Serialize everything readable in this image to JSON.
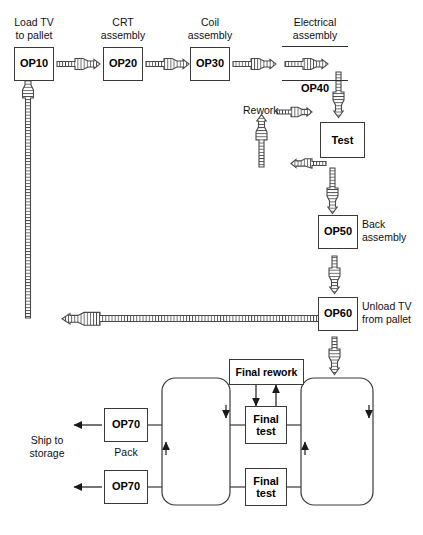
{
  "diagram": {
    "line_color": "#3a3a3a",
    "fill_color": "#ffffff",
    "text_color": "#000000"
  },
  "stations": {
    "op10": {
      "code": "OP10",
      "caption": "Load TV\nto pallet"
    },
    "op20": {
      "code": "OP20",
      "caption": "CRT\nassembly"
    },
    "op30": {
      "code": "OP30",
      "caption": "Coil\nassembly"
    },
    "op40": {
      "code": "OP40",
      "caption": "Electrical\nassembly"
    },
    "op50": {
      "code": "OP50",
      "caption": "Back\nassembly"
    },
    "op60": {
      "code": "OP60",
      "caption": "Unload TV\nfrom pallet"
    },
    "op70_upper": {
      "code": "OP70",
      "caption": "Pack"
    },
    "op70_lower": {
      "code": "OP70",
      "caption": ""
    }
  },
  "nodes": {
    "test": {
      "label": "Test"
    },
    "rework": {
      "label": "Rework"
    },
    "final_rework": {
      "label": "Final rework"
    },
    "final_test_upper": {
      "label": "Final\ntest"
    },
    "final_test_lower": {
      "label": "Final\ntest"
    }
  },
  "outputs": {
    "ship": {
      "label": "Ship to\nstorage"
    }
  },
  "figure_caption": {
    "text": ""
  }
}
